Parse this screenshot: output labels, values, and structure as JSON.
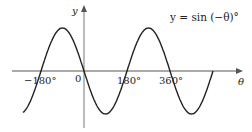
{
  "chart_data": {
    "type": "line",
    "title": "",
    "equation_label": "y = sin (−θ)°",
    "xlabel": "θ",
    "ylabel": "y",
    "origin_label": "0",
    "x_ticks": [
      {
        "value": -180,
        "label": "−180°"
      },
      {
        "value": 180,
        "label": "180°"
      },
      {
        "value": 360,
        "label": "360°"
      }
    ],
    "xlim": [
      -270,
      540
    ],
    "ylim": [
      -1,
      1
    ],
    "series": [
      {
        "name": "y = sin(−θ)",
        "x": [
          -270,
          -180,
          -90,
          0,
          90,
          180,
          270,
          360,
          450,
          540
        ],
        "values": [
          -1,
          0,
          1,
          0,
          -1,
          0,
          1,
          0,
          -1,
          0
        ]
      }
    ],
    "grid": false,
    "legend": "none"
  }
}
